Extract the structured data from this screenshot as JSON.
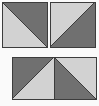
{
  "figure": {
    "name": "half-square-triangle-tile-diagram",
    "description": "Geometric pattern of three panels built from light and dark gray right triangles",
    "background_color": "#fafafa",
    "stroke_color": "#3c3c3c",
    "colors": {
      "dark_gray": "#707070",
      "light_gray": "#d2d2d2"
    },
    "canvas": {
      "width": 99,
      "height": 106
    },
    "panels": [
      {
        "id": "top-left-square",
        "label": "Top left square",
        "x": 2,
        "y": 2,
        "width": 45,
        "height": 45,
        "diagonal": "top-left-to-bottom-right",
        "triangles": [
          {
            "position": "upper-right",
            "fill": "dark_gray",
            "points": "0,0 45,0 45,45"
          },
          {
            "position": "lower-left",
            "fill": "light_gray",
            "points": "0,0 45,45 0,45"
          }
        ]
      },
      {
        "id": "top-right-square",
        "label": "Top right square",
        "x": 50,
        "y": 2,
        "width": 45,
        "height": 45,
        "diagonal": "top-right-to-bottom-left",
        "triangles": [
          {
            "position": "upper-left",
            "fill": "light_gray",
            "points": "0,0 45,0 0,45"
          },
          {
            "position": "lower-right",
            "fill": "dark_gray",
            "points": "45,0 45,45 0,45"
          }
        ]
      },
      {
        "id": "bottom-left-square",
        "label": "Bottom left square",
        "x": 12,
        "y": 57,
        "width": 42,
        "height": 42,
        "diagonal": "top-right-to-bottom-left",
        "triangles": [
          {
            "position": "upper-left",
            "fill": "dark_gray",
            "points": "0,0 42,0 0,42"
          },
          {
            "position": "lower-right",
            "fill": "light_gray",
            "points": "42,0 42,42 0,42"
          }
        ]
      },
      {
        "id": "bottom-right-square",
        "label": "Bottom right square",
        "x": 54,
        "y": 57,
        "width": 42,
        "height": 42,
        "diagonal": "top-left-to-bottom-right",
        "triangles": [
          {
            "position": "upper-right",
            "fill": "light_gray",
            "points": "0,0 42,0 42,42"
          },
          {
            "position": "lower-left",
            "fill": "dark_gray",
            "points": "0,0 42,42 0,42"
          }
        ]
      }
    ]
  }
}
